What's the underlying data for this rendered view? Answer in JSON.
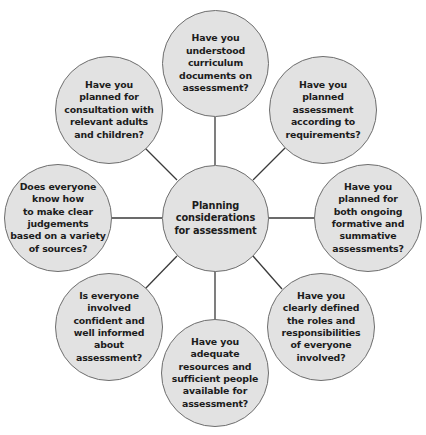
{
  "diagram": {
    "type": "hub-and-spoke",
    "colors": {
      "node_fill": "#e2e2e2",
      "node_border": "#6e6e6e",
      "connector": "#3a3a3a",
      "text": "#1c1c1c",
      "background": "#ffffff"
    },
    "center": {
      "label": "Planning\nconsiderations\nfor assessment"
    },
    "nodes": [
      {
        "position": "top",
        "label": "Have you\nunderstood\ncurriculum\ndocuments on\nassessment?"
      },
      {
        "position": "top-right",
        "label": "Have you\nplanned\nassessment\naccording to\nrequirements?"
      },
      {
        "position": "right",
        "label": "Have you\nplanned for\nboth ongoing\nformative and\nsummative\nassessments?"
      },
      {
        "position": "bottom-right",
        "label": "Have you\nclearly defined\nthe roles and\nresponsibilities\nof everyone\ninvolved?"
      },
      {
        "position": "bottom",
        "label": "Have you\nadequate\nresources and\nsufficient people\navailable for\nassessment?"
      },
      {
        "position": "bottom-left",
        "label": "Is everyone\ninvolved\nconfident and\nwell informed\nabout\nassessment?"
      },
      {
        "position": "left",
        "label": "Does everyone\nknow how\nto make clear\njudgements\nbased on a variety\nof sources?"
      },
      {
        "position": "top-left",
        "label": "Have you\nplanned for\nconsultation with\nrelevant adults\nand children?"
      }
    ]
  }
}
